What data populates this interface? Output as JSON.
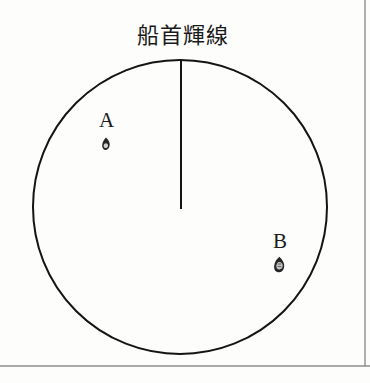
{
  "figure": {
    "kind": "radar-ppi-scope-diagram",
    "title": "船首輝線",
    "width": 370,
    "height": 383,
    "background_color": "#fdfdfc",
    "ink_color": "#1a1a1a",
    "border_color": "#8a8a8a"
  },
  "scope": {
    "center_x": 180,
    "center_y": 207,
    "radius": 147,
    "stroke_width": 2,
    "stroke_color": "#141414"
  },
  "heading_line": {
    "name": "船首輝線",
    "x": 181,
    "y_top": 59,
    "y_bottom": 209,
    "stroke_width": 2,
    "stroke_color": "#141414"
  },
  "targets": [
    {
      "id": "A",
      "label": "A",
      "label_x": 107,
      "label_y": 121,
      "blip_x": 106,
      "blip_y": 144,
      "blip_width": 7,
      "blip_height": 12,
      "blip_color": "#262626"
    },
    {
      "id": "B",
      "label": "B",
      "label_x": 282,
      "label_y": 242,
      "blip_x": 279,
      "blip_y": 264,
      "blip_width": 9,
      "blip_height": 14,
      "blip_color": "#262626"
    }
  ],
  "frame": {
    "bottom_rule_y": 366,
    "bottom_rule_x1": 0,
    "bottom_rule_x2": 370,
    "right_rule_x": 365,
    "right_rule_y1": 0,
    "right_rule_y2": 366,
    "rule_color": "#8d8d8d",
    "rule_width": 1.4
  }
}
